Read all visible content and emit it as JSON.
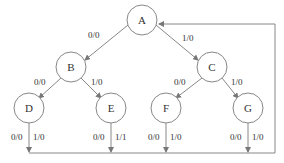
{
  "diagram": {
    "type": "state-transition-tree",
    "colors": {
      "stroke": "#777777",
      "text": "#333333",
      "background": "#ffffff"
    },
    "nodes": [
      {
        "id": "A",
        "label": "A",
        "x": 142,
        "y": 20
      },
      {
        "id": "B",
        "label": "B",
        "x": 71,
        "y": 67
      },
      {
        "id": "C",
        "label": "C",
        "x": 212,
        "y": 67
      },
      {
        "id": "D",
        "label": "D",
        "x": 29,
        "y": 108
      },
      {
        "id": "E",
        "label": "E",
        "x": 111,
        "y": 108
      },
      {
        "id": "F",
        "label": "F",
        "x": 166,
        "y": 108
      },
      {
        "id": "G",
        "label": "G",
        "x": 248,
        "y": 108
      }
    ],
    "edges": [
      {
        "from": "A",
        "to": "B",
        "label": "0/0"
      },
      {
        "from": "A",
        "to": "C",
        "label": "1/0"
      },
      {
        "from": "B",
        "to": "D",
        "label": "0/0"
      },
      {
        "from": "B",
        "to": "E",
        "label": "1/0"
      },
      {
        "from": "C",
        "to": "F",
        "label": "0/0"
      },
      {
        "from": "C",
        "to": "G",
        "label": "1/0"
      }
    ],
    "return_edges": [
      {
        "from": "D",
        "label_left": "0/0",
        "label_right": "1/0"
      },
      {
        "from": "E",
        "label_left": "0/0",
        "label_right": "1/1"
      },
      {
        "from": "F",
        "label_left": "0/0",
        "label_right": "1/0"
      },
      {
        "from": "G",
        "label_left": "0/0",
        "label_right": "1/0"
      }
    ],
    "return_target": "A"
  }
}
